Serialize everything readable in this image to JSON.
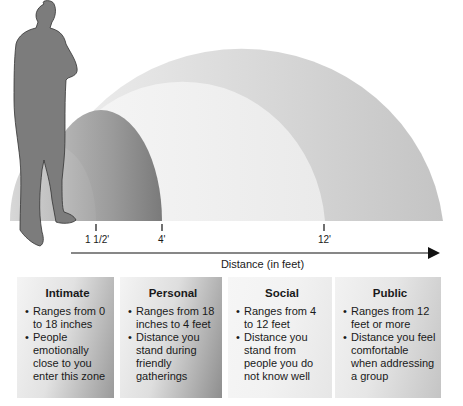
{
  "diagram": {
    "axis": {
      "label": "Distance (in feet)",
      "ticks": [
        {
          "label": "1 1/2'",
          "x": 96
        },
        {
          "label": "4'",
          "x": 162
        },
        {
          "label": "12'",
          "x": 324
        }
      ]
    },
    "colors": {
      "public_arc": "#c8c8c8",
      "social_arc": "#ececec",
      "personal_arc": "#8c8c8c",
      "intimate_arc": "#b0b0b0",
      "silhouette": "#7a7a7a",
      "axis": "#111111"
    },
    "zones": [
      {
        "name": "Intimate",
        "bullets": [
          "Ranges from 0 to 18 inches",
          "People emotionally close to you enter this zone"
        ]
      },
      {
        "name": "Personal",
        "bullets": [
          "Ranges from 18 inches to 4 feet",
          "Distance you stand during friendly gatherings"
        ]
      },
      {
        "name": "Social",
        "bullets": [
          "Ranges from 4 to 12 feet",
          "Distance you stand from people you do not know well"
        ]
      },
      {
        "name": "Public",
        "bullets": [
          "Ranges from 12 feet or more",
          "Distance you feel comfortable when addressing a group"
        ]
      }
    ]
  }
}
